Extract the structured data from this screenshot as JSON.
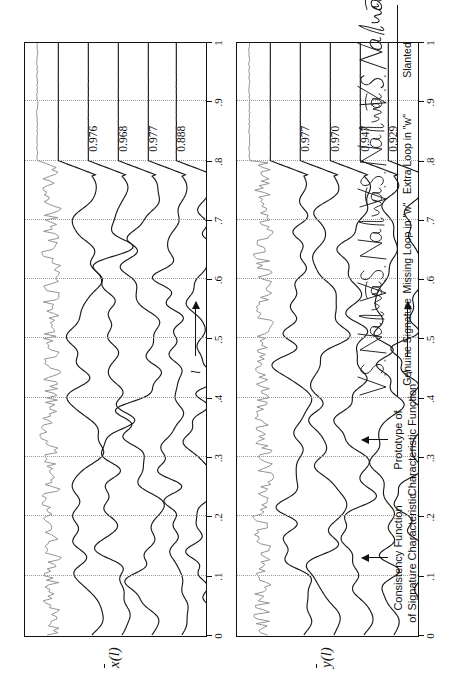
{
  "figure": {
    "panels": [
      {
        "id": "x-panel",
        "ylabel": "x",
        "ylabel_arg": "(l)",
        "axis_title": "l",
        "scores": [
          "0.976",
          "0.968",
          "0.977",
          "0.888"
        ]
      },
      {
        "id": "y-panel",
        "ylabel": "y",
        "ylabel_arg": "(l)",
        "axis_title": "l",
        "scores": [
          "0.977",
          "0.970",
          "0.947",
          "0.929"
        ]
      }
    ],
    "axis_ticks": [
      "0",
      ".1",
      ".2",
      ".3",
      ".4",
      ".5",
      ".6",
      ".7",
      ".8",
      ".9",
      "1"
    ],
    "callouts": [
      {
        "line1": "Consistency Function",
        "line2": "of Signature Characteristic"
      },
      {
        "line1": "Prototype of",
        "line2": "Characteristic Function"
      }
    ],
    "signatures": [
      {
        "name": "V. S. Nalwa",
        "caption": "Genuine Signature"
      },
      {
        "name": "V. S. Nalwa",
        "caption": "Missing Loop in \"w\""
      },
      {
        "name": "V. S. Nalwa",
        "caption": "Extra Loop in \"w\""
      },
      {
        "name": "V. S. Nalwa",
        "caption": "Slanted"
      }
    ],
    "colors": {
      "trace": "#1a1a1a",
      "consistency_trace": "#8e8e8e",
      "grid": "#9a9a9a",
      "frame": "#111111"
    }
  },
  "chart_data": {
    "type": "line",
    "title": "",
    "xlabel": "l",
    "ylabel": "",
    "xlim": [
      0,
      1
    ],
    "grid": true,
    "legend": "none",
    "panels": [
      {
        "name": "x-bar(l)",
        "ylabel": "x̄(l)",
        "traces": [
          {
            "name": "consistency-function",
            "style": "gray",
            "score": null
          },
          {
            "name": "prototype-characteristic-function",
            "style": "black",
            "score": null
          },
          {
            "name": "genuine-signature",
            "style": "black",
            "score": 0.976
          },
          {
            "name": "missing-loop-in-w",
            "style": "black",
            "score": 0.968
          },
          {
            "name": "extra-loop-in-w",
            "style": "black",
            "score": 0.977
          },
          {
            "name": "slanted",
            "style": "black",
            "score": 0.888
          }
        ]
      },
      {
        "name": "y-bar(l)",
        "ylabel": "ȳ(l)",
        "traces": [
          {
            "name": "consistency-function",
            "style": "gray",
            "score": null
          },
          {
            "name": "prototype-characteristic-function",
            "style": "black",
            "score": null
          },
          {
            "name": "genuine-signature",
            "style": "black",
            "score": 0.977
          },
          {
            "name": "missing-loop-in-w",
            "style": "black",
            "score": 0.97
          },
          {
            "name": "extra-loop-in-w",
            "style": "black",
            "score": 0.947
          },
          {
            "name": "slanted",
            "style": "black",
            "score": 0.929
          }
        ]
      }
    ],
    "xticks": [
      0,
      0.1,
      0.2,
      0.3,
      0.4,
      0.5,
      0.6,
      0.7,
      0.8,
      0.9,
      1.0
    ],
    "xticklabels": [
      "0",
      ".1",
      ".2",
      ".3",
      ".4",
      ".5",
      ".6",
      ".7",
      ".8",
      ".9",
      "1"
    ]
  }
}
